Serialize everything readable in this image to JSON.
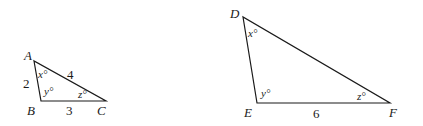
{
  "diagram": {
    "small_triangle": {
      "vertices": {
        "A": "A",
        "B": "B",
        "C": "C"
      },
      "sides": {
        "AB": "2",
        "AC": "4",
        "BC": "3"
      },
      "angles": {
        "A": "x°",
        "B": "y°",
        "C": "z°"
      }
    },
    "large_triangle": {
      "vertices": {
        "D": "D",
        "E": "E",
        "F": "F"
      },
      "sides": {
        "EF": "6"
      },
      "angles": {
        "D": "x°",
        "E": "y°",
        "F": "z°"
      }
    }
  }
}
